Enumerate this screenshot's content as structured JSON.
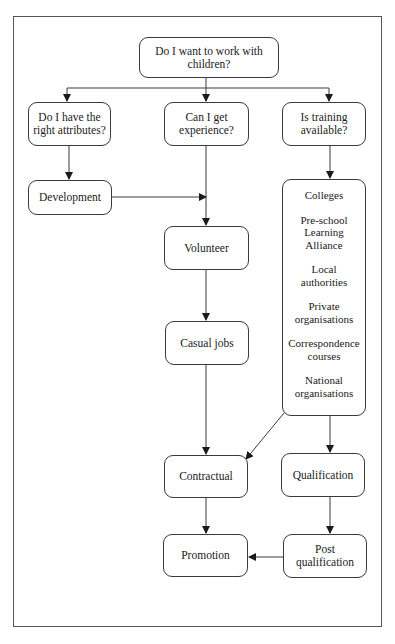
{
  "diagram": {
    "type": "flowchart",
    "nodes": {
      "root": {
        "label": "Do I want to work with children?"
      },
      "attributes": {
        "label": "Do I have the right attributes?"
      },
      "experience": {
        "label": "Can I get experience?"
      },
      "training": {
        "label": "Is training available?"
      },
      "development": {
        "label": "Development"
      },
      "volunteer": {
        "label": "Volunteer"
      },
      "casual_jobs": {
        "label": "Casual jobs"
      },
      "providers": {
        "items": [
          "Colleges",
          "Pre-school Learning Alliance",
          "Local authorities",
          "Private organisations",
          "Correspondence courses",
          "National organisations"
        ]
      },
      "contractual": {
        "label": "Contractual"
      },
      "qualification": {
        "label": "Qualification"
      },
      "promotion": {
        "label": "Promotion"
      },
      "post_qualification": {
        "label": "Post qualification"
      }
    },
    "edges": [
      [
        "root",
        "attributes"
      ],
      [
        "root",
        "experience"
      ],
      [
        "root",
        "training"
      ],
      [
        "attributes",
        "development"
      ],
      [
        "development",
        "experience-line"
      ],
      [
        "experience",
        "volunteer"
      ],
      [
        "volunteer",
        "casual_jobs"
      ],
      [
        "casual_jobs",
        "contractual"
      ],
      [
        "training",
        "providers"
      ],
      [
        "providers",
        "contractual"
      ],
      [
        "providers",
        "qualification"
      ],
      [
        "contractual",
        "promotion"
      ],
      [
        "qualification",
        "post_qualification"
      ],
      [
        "post_qualification",
        "promotion"
      ]
    ],
    "colors": {
      "line": "#3a3a3a",
      "background": "#ffffff"
    }
  }
}
